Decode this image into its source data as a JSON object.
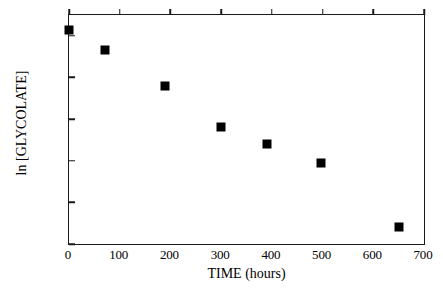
{
  "chart_data": {
    "type": "scatter",
    "title": "",
    "xlabel": "TIME (hours)",
    "ylabel": "ln [GLYCOLATE]",
    "xlim": [
      0,
      700
    ],
    "ylim": [
      -2.6,
      -1.5
    ],
    "xticks": [
      0,
      100,
      200,
      300,
      400,
      500,
      600,
      700
    ],
    "xticklabels": [
      "0",
      "100",
      "200",
      "300",
      "400",
      "500",
      "600",
      "700"
    ],
    "yticks": [
      -1.6,
      -1.8,
      -2,
      -2.2,
      -2.4,
      -2.6
    ],
    "yticklabels": [
      "-1.6",
      "-1.8",
      "-2",
      "-2.2",
      "-2.4",
      "-2.6"
    ],
    "grid": false,
    "legend": false,
    "marker_color": "#000000",
    "marker_shape": "square",
    "axis_color": "#1a1a1a",
    "background": "#ffffff",
    "series": [
      {
        "name": "ln [GLYCOLATE]",
        "x": [
          0,
          70,
          190,
          300,
          390,
          496,
          650
        ],
        "y": [
          -1.57,
          -1.67,
          -1.84,
          -2.04,
          -2.12,
          -2.21,
          -2.52
        ]
      }
    ]
  }
}
